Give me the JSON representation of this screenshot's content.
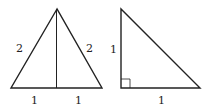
{
  "diagram": {
    "stroke_color": "#222222",
    "triangles": [
      {
        "name": "equilateral-triangle",
        "labels": {
          "left_side": "2",
          "right_side": "2",
          "base_left": "1",
          "base_right": "1"
        }
      },
      {
        "name": "right-triangle",
        "labels": {
          "vertical_leg": "1",
          "horizontal_leg": "1"
        }
      }
    ]
  }
}
